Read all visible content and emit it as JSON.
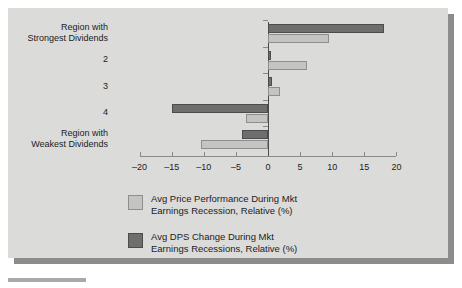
{
  "chart_data": {
    "type": "bar",
    "orientation": "horizontal",
    "title": "",
    "xlabel": "",
    "ylabel": "",
    "xlim": [
      -20,
      20
    ],
    "xticks": [
      -20,
      -15,
      -10,
      -5,
      0,
      5,
      10,
      15,
      20
    ],
    "xticklabels": [
      "–20",
      "–15",
      "–10",
      "–5",
      "0",
      "5",
      "10",
      "15",
      "20"
    ],
    "grid": false,
    "legend_position": "below-axes",
    "categories": [
      "Region with Strongest Dividends",
      "2",
      "3",
      "4",
      "Region with Weakest Dividends"
    ],
    "category_lines": [
      [
        "Region with",
        "Strongest Dividends"
      ],
      [
        "2"
      ],
      [
        "3"
      ],
      [
        "4"
      ],
      [
        "Region with",
        "Weakest Dividends"
      ]
    ],
    "series": [
      {
        "name": "Avg DPS Change During Mkt Earnings Recessions, Relative (%)",
        "color": "#6e6e6e",
        "values": [
          18.0,
          0.5,
          0.7,
          -15.0,
          -4.0
        ]
      },
      {
        "name": "Avg Price Performance During Mkt Earnings Recession, Relative (%)",
        "color": "#c4c4c2",
        "values": [
          9.5,
          6.0,
          1.8,
          -3.5,
          -10.5
        ]
      }
    ]
  },
  "legend": {
    "entries": [
      {
        "swatch": "light",
        "line1": "Avg Price Performance During Mkt",
        "line2": "Earnings Recession, Relative (%)"
      },
      {
        "swatch": "dark",
        "line1": "Avg DPS Change During Mkt",
        "line2": "Earnings Recessions, Relative (%)"
      }
    ]
  },
  "colors": {
    "panel_background": "#dbdbd9",
    "panel_shadow": "#8c8c8a",
    "dark_bar": "#6e6e6e",
    "light_bar": "#c4c4c2",
    "axis": "#4a4a4a",
    "text": "#1c1c1c"
  }
}
